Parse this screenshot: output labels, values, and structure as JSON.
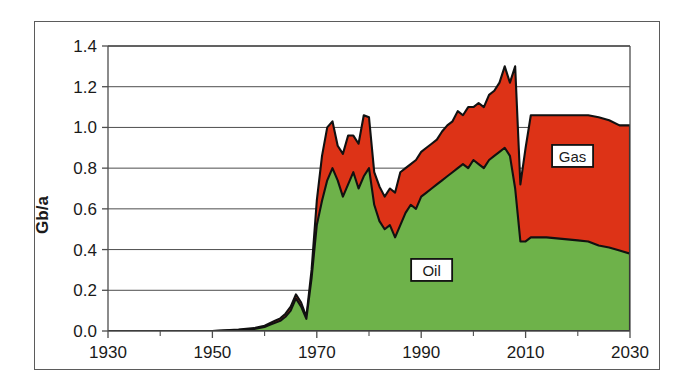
{
  "chart_data": {
    "type": "area",
    "title": "",
    "subtitle": "",
    "xlabel": "",
    "ylabel": "Gb/a",
    "xlim": [
      1930,
      2030
    ],
    "ylim": [
      0.0,
      1.4
    ],
    "grid": true,
    "stacked": true,
    "legend_position": "inline-labels",
    "x_tick_labels": [
      "1930",
      "1950",
      "1970",
      "1990",
      "2010",
      "2030"
    ],
    "x_major_ticks": [
      1930,
      1950,
      1970,
      1990,
      2010,
      2030
    ],
    "x_minor_ticks": [
      1940,
      1960,
      1980,
      2000,
      2020
    ],
    "y_tick_labels": [
      "0.0",
      "0.2",
      "0.4",
      "0.6",
      "0.8",
      "1.0",
      "1.2",
      "1.4"
    ],
    "y_ticks": [
      0.0,
      0.2,
      0.4,
      0.6,
      0.8,
      1.0,
      1.2,
      1.4
    ],
    "colors": {
      "oil": "#6eb24a",
      "gas": "#dd3317",
      "outline": "#111111",
      "frame": "#5b5b5b",
      "gridline": "#4d4d4d",
      "text": "#1a1a1a",
      "background": "#ffffff"
    },
    "x": [
      1930,
      1935,
      1940,
      1945,
      1950,
      1955,
      1958,
      1960,
      1961,
      1962,
      1963,
      1964,
      1965,
      1966,
      1967,
      1968,
      1969,
      1970,
      1971,
      1972,
      1973,
      1974,
      1975,
      1976,
      1977,
      1978,
      1979,
      1980,
      1981,
      1982,
      1983,
      1984,
      1985,
      1986,
      1987,
      1988,
      1989,
      1990,
      1991,
      1992,
      1993,
      1994,
      1995,
      1996,
      1997,
      1998,
      1999,
      2000,
      2001,
      2002,
      2003,
      2004,
      2005,
      2006,
      2007,
      2008,
      2009,
      2010,
      2011,
      2012,
      2013,
      2014,
      2016,
      2018,
      2020,
      2022,
      2024,
      2026,
      2028,
      2030
    ],
    "series": [
      {
        "name": "Oil",
        "label": "Oil",
        "color": "#6eb24a",
        "values": [
          0.0,
          0.0,
          0.0,
          0.0,
          0.0,
          0.005,
          0.01,
          0.02,
          0.03,
          0.04,
          0.05,
          0.07,
          0.1,
          0.16,
          0.12,
          0.06,
          0.26,
          0.52,
          0.64,
          0.74,
          0.8,
          0.74,
          0.66,
          0.72,
          0.78,
          0.7,
          0.76,
          0.8,
          0.62,
          0.54,
          0.5,
          0.52,
          0.46,
          0.52,
          0.58,
          0.62,
          0.6,
          0.66,
          0.68,
          0.7,
          0.72,
          0.74,
          0.76,
          0.78,
          0.8,
          0.82,
          0.8,
          0.84,
          0.82,
          0.8,
          0.84,
          0.86,
          0.88,
          0.9,
          0.86,
          0.7,
          0.44,
          0.44,
          0.46,
          0.46,
          0.46,
          0.46,
          0.455,
          0.45,
          0.445,
          0.44,
          0.42,
          0.41,
          0.395,
          0.38
        ]
      },
      {
        "name": "Gas",
        "label": "Gas",
        "color": "#dd3317",
        "values": [
          0.0,
          0.0,
          0.0,
          0.0,
          0.0,
          0.002,
          0.004,
          0.006,
          0.008,
          0.01,
          0.012,
          0.015,
          0.02,
          0.02,
          0.02,
          0.01,
          0.04,
          0.12,
          0.22,
          0.26,
          0.23,
          0.17,
          0.21,
          0.24,
          0.18,
          0.22,
          0.3,
          0.25,
          0.16,
          0.17,
          0.16,
          0.18,
          0.22,
          0.26,
          0.22,
          0.2,
          0.24,
          0.22,
          0.22,
          0.22,
          0.22,
          0.24,
          0.25,
          0.25,
          0.28,
          0.24,
          0.3,
          0.26,
          0.3,
          0.3,
          0.32,
          0.32,
          0.34,
          0.4,
          0.36,
          0.6,
          0.28,
          0.46,
          0.6,
          0.6,
          0.6,
          0.6,
          0.605,
          0.61,
          0.615,
          0.62,
          0.63,
          0.625,
          0.615,
          0.63
        ]
      }
    ],
    "annotations": [
      {
        "name": "oil-label",
        "text": "Oil",
        "x": 1992,
        "y": 0.3
      },
      {
        "name": "gas-label",
        "text": "Gas",
        "x": 2019,
        "y": 0.86
      }
    ],
    "notable_points": {
      "peak_total_year": 2008,
      "peak_total_value": 1.3,
      "first_peak_year": 1973,
      "first_peak_value": 1.03,
      "second_peak_year": 1979,
      "second_peak_value": 1.06,
      "final_year": 2030,
      "final_total_value": 1.01,
      "final_oil_value": 0.38,
      "plateau_value": 1.06
    }
  }
}
